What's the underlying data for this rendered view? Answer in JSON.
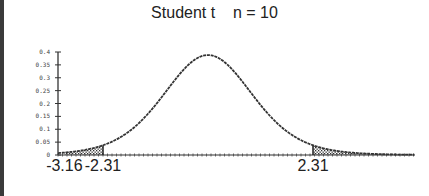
{
  "title": "Student t    n = 10",
  "chart_data": {
    "type": "area",
    "title": "Student t    n = 10",
    "distribution": "Student t",
    "n": 10,
    "degrees_of_freedom": 9,
    "xlabel": "",
    "ylabel": "",
    "xlim": [
      -3.3,
      4.55
    ],
    "ylim": [
      0,
      0.4
    ],
    "yticks": [
      "0",
      "0.05",
      "0.1",
      "0.15",
      "0.2",
      "0.25",
      "0.3",
      "0.35",
      "0.4"
    ],
    "ytick_values": [
      0,
      0.05,
      0.1,
      0.15,
      0.2,
      0.25,
      0.3,
      0.35,
      0.4
    ],
    "x_annotations": [
      {
        "label": "-3.16",
        "x": -3.16
      },
      {
        "label": "-2.31",
        "x": -2.31
      },
      {
        "label": "2.31",
        "x": 2.31
      }
    ],
    "shaded_regions": [
      {
        "from": -3.16,
        "to": -2.31,
        "pattern": "stipple"
      },
      {
        "from": 2.31,
        "to": 4.55,
        "pattern": "stipple"
      }
    ],
    "peak": {
      "x": 0,
      "y": 0.388
    },
    "grid": false,
    "legend": null
  }
}
